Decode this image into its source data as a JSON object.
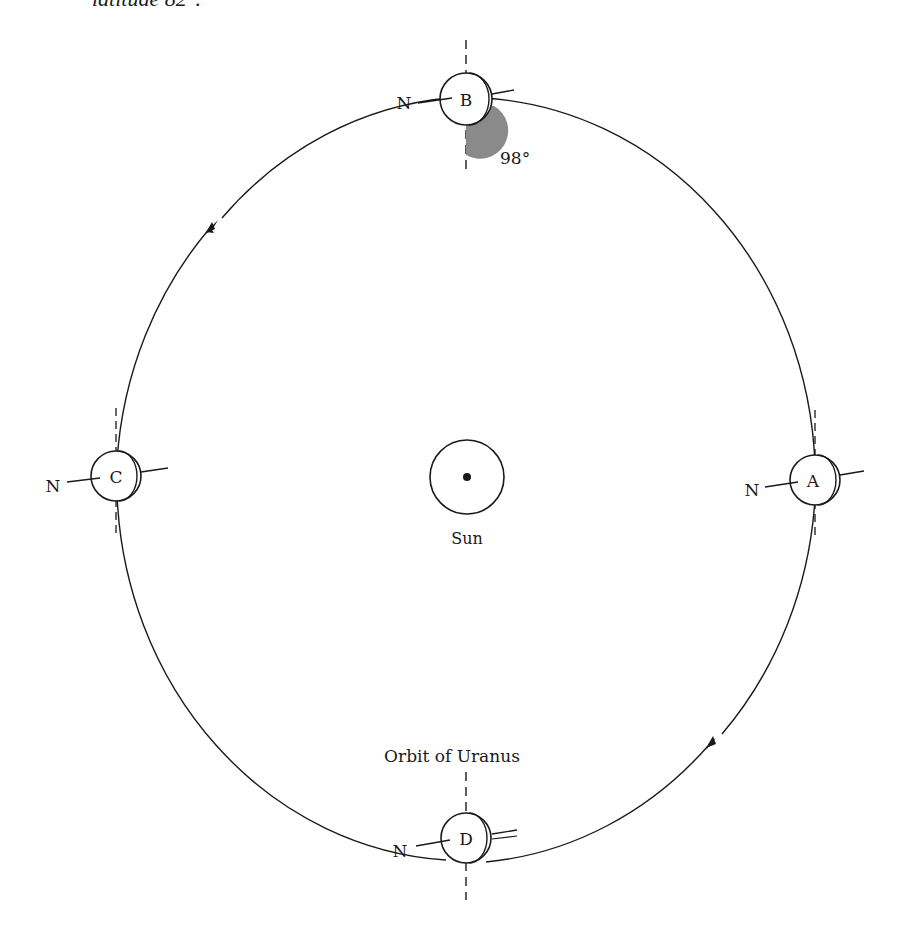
{
  "caption_partial": "latitude 82°.",
  "title": "Orbit of Uranus",
  "sun": {
    "label": "Sun"
  },
  "angle_label": "98°",
  "north_label": "N",
  "positions": [
    {
      "id": "A",
      "label": "A"
    },
    {
      "id": "B",
      "label": "B"
    },
    {
      "id": "C",
      "label": "C"
    },
    {
      "id": "D",
      "label": "D"
    }
  ],
  "colors": {
    "ink": "#1a1a1a",
    "shade": "#8a8a8a"
  }
}
